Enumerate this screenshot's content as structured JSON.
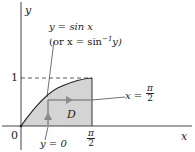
{
  "diagram": {
    "axis_x_label": "x",
    "axis_y_label": "y",
    "origin_label": "0",
    "y_tick_label": "1",
    "x_tick_num": "π",
    "x_tick_den": "2",
    "curve_label": "y = sin x",
    "curve_alt_label": "(or x = sin",
    "curve_alt_sup": "−1",
    "curve_alt_end": "y)",
    "bound_right_prefix": "x =",
    "bound_right_num": "π",
    "bound_right_den": "2",
    "bound_bottom_label": "y = 0",
    "region_label": "D",
    "colors": {
      "region_fill": "#d4d4d4",
      "arrow": "#8a8a8a",
      "curve": "#222222",
      "axis": "#444444"
    }
  }
}
